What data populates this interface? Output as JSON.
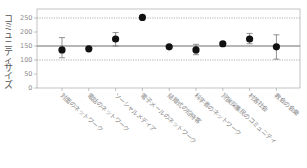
{
  "chart_data": {
    "type": "scatter",
    "title": "",
    "xlabel": "",
    "ylabel": "コミュニティサイズ",
    "ylim": [
      0,
      280
    ],
    "yticks": [
      0,
      50,
      100,
      150,
      200,
      250
    ],
    "reference_lines": [
      {
        "value": 150,
        "style": "solid"
      },
      {
        "value": 100,
        "style": "dotted"
      },
      {
        "value": 250,
        "style": "dotted"
      }
    ],
    "grid": false,
    "legend": null,
    "categories": [
      "対面のネットワーク",
      "電話のネットワーク",
      "ソーシャルメディア",
      "電子メールのネットワーク",
      "結婚式の招待客",
      "科学者のネットワーク",
      "狩猟採集民のコミュニティ",
      "村落社会",
      "教会の会衆"
    ],
    "series": [
      {
        "name": "mean",
        "values": [
          136,
          140,
          175,
          252,
          147,
          136,
          158,
          175,
          147
        ],
        "err_low": [
          108,
          136,
          150,
          252,
          147,
          119,
          150,
          158,
          103
        ],
        "err_high": [
          180,
          146,
          198,
          252,
          147,
          156,
          166,
          195,
          190
        ]
      }
    ]
  }
}
